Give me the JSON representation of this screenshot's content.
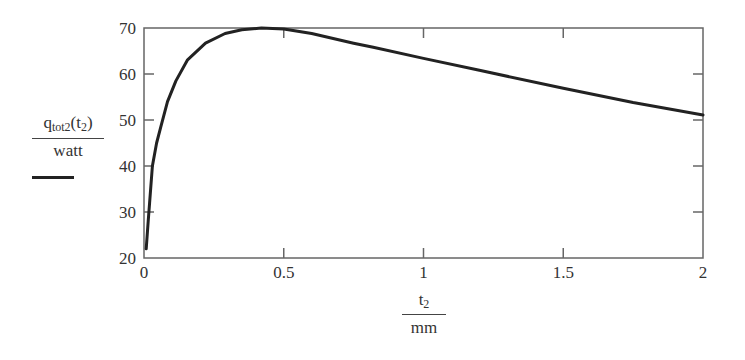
{
  "chart_data": {
    "type": "line",
    "title": "",
    "xlabel": "t2 / mm",
    "ylabel": "q_tot2(t2) / watt",
    "xlim": [
      0,
      2
    ],
    "ylim": [
      20,
      70
    ],
    "grid": false,
    "legend_position": "left, under y-label",
    "x_ticks": [
      0,
      0.5,
      1,
      1.5,
      2
    ],
    "x_tick_labels": [
      "0",
      "0.5",
      "1",
      "1.5",
      "2"
    ],
    "y_ticks": [
      20,
      30,
      40,
      50,
      60,
      70
    ],
    "y_tick_labels": [
      "20",
      "30",
      "40",
      "50",
      "60",
      "70"
    ],
    "series": [
      {
        "name": "q_tot2(t2)/watt",
        "color": "#222222",
        "x": [
          0.008,
          0.015,
          0.02,
          0.03,
          0.045,
          0.06,
          0.084,
          0.114,
          0.155,
          0.22,
          0.29,
          0.35,
          0.42,
          0.5,
          0.6,
          0.75,
          0.82,
          1.0,
          1.2,
          1.5,
          1.75,
          2.0
        ],
        "values": [
          22,
          28,
          32,
          40,
          45,
          48.5,
          54,
          58.5,
          63,
          66.7,
          68.8,
          69.6,
          70,
          69.8,
          68.8,
          66.7,
          65.8,
          63.4,
          60.8,
          56.9,
          53.8,
          51.1
        ]
      }
    ]
  },
  "labels": {
    "y_numerator_main": "q",
    "y_numerator_sub": "tot2",
    "y_numerator_arg_open": "(t",
    "y_numerator_arg_sub": "2",
    "y_numerator_arg_close": ")",
    "y_denominator": "watt",
    "x_numerator_main": "t",
    "x_numerator_sub": "2",
    "x_denominator": "mm"
  }
}
